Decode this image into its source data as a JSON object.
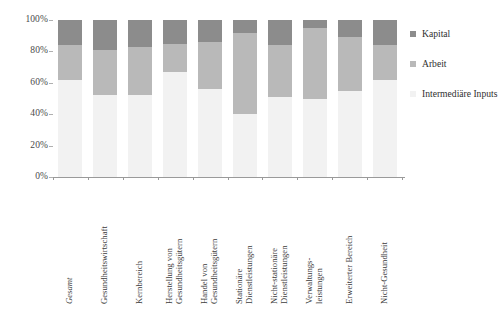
{
  "chart_data": {
    "type": "bar",
    "subtype": "stacked-percentage-column",
    "title": "",
    "xlabel": "",
    "ylabel": "",
    "ylim": [
      0,
      100
    ],
    "yticks": [
      "0%",
      "20%",
      "40%",
      "60%",
      "80%",
      "100%"
    ],
    "ytick_values": [
      0,
      20,
      40,
      60,
      80,
      100
    ],
    "grid": false,
    "legend_position": "right",
    "stack_order_bottom_to_top": [
      "Intermediäre Inputs",
      "Arbeit",
      "Kapital"
    ],
    "categories": [
      "Gesamt",
      "Gesundheitswirtschaft",
      "Kernbereich",
      "Herstellung von Gesundheitsgütern",
      "Handel von Gesundheitsgütern",
      "Stationäre Dienstleistungen",
      "Nicht-stationäre Dienstleistungen",
      "Verwaltungsleistungen",
      "Erweiterter Bereich",
      "Nicht-Gesundheit"
    ],
    "series": [
      {
        "name": "Intermediäre Inputs",
        "color": "#f2f2f2",
        "values": [
          62,
          52,
          52,
          67,
          56,
          40,
          51,
          50,
          55,
          62
        ]
      },
      {
        "name": "Arbeit",
        "color": "#b9b9b9",
        "values": [
          22,
          29,
          31,
          18,
          30,
          52,
          33,
          45,
          34,
          22
        ]
      },
      {
        "name": "Kapital",
        "color": "#8c8c8c",
        "values": [
          16,
          19,
          17,
          15,
          14,
          8,
          16,
          5,
          11,
          16
        ]
      }
    ]
  },
  "axis": {
    "y_ticks": [
      {
        "label": "100%",
        "value": 100
      },
      {
        "label": "80%",
        "value": 80
      },
      {
        "label": "60%",
        "value": 60
      },
      {
        "label": "40%",
        "value": 40
      },
      {
        "label": "20%",
        "value": 20
      },
      {
        "label": "0%",
        "value": 0
      }
    ]
  },
  "x_labels": [
    {
      "line1": "Gesamt",
      "line2": "",
      "italic": true
    },
    {
      "line1": "Gesundheitswirtschaft",
      "line2": "",
      "italic": false
    },
    {
      "line1": "Kernbereich",
      "line2": "",
      "italic": false
    },
    {
      "line1": "Herstellung von",
      "line2": "Gesundheitsgütern",
      "italic": false
    },
    {
      "line1": "Handel von",
      "line2": "Gesundheitsgütern",
      "italic": false
    },
    {
      "line1": "Stationäre",
      "line2": "Dienstleistungen",
      "italic": false
    },
    {
      "line1": "Nicht-stationäre",
      "line2": "Dienstleistungen",
      "italic": false
    },
    {
      "line1": "Verwaltungs-",
      "line2": "leistungen",
      "italic": false
    },
    {
      "line1": "Erweiterter Bereich",
      "line2": "",
      "italic": false
    },
    {
      "line1": "Nicht-Gesundheit",
      "line2": "",
      "italic": false
    }
  ],
  "legend": {
    "items": [
      {
        "label": "Kapital",
        "color": "#8c8c8c",
        "wrap": false
      },
      {
        "label": "Arbeit",
        "color": "#b9b9b9",
        "wrap": false
      },
      {
        "label": "Intermediäre Inputs",
        "color": "#f2f2f2",
        "wrap": true
      }
    ]
  },
  "colors": {
    "kapital": "#8c8c8c",
    "arbeit": "#b9b9b9",
    "intermediaere": "#f2f2f2",
    "axis": "#9a9a9a",
    "text": "#3a3a3a",
    "background": "#ffffff"
  }
}
